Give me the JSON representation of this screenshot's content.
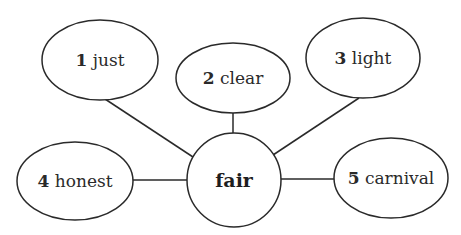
{
  "diagram": {
    "type": "word-web",
    "center": {
      "label": "fair"
    },
    "nodes": [
      {
        "number": "1",
        "word": "just"
      },
      {
        "number": "2",
        "word": "clear"
      },
      {
        "number": "3",
        "word": "light"
      },
      {
        "number": "4",
        "word": "honest"
      },
      {
        "number": "5",
        "word": "carnival"
      }
    ]
  }
}
